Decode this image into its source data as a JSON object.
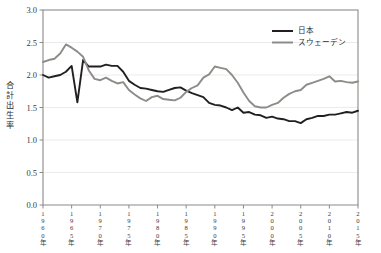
{
  "chart_data": {
    "type": "line",
    "title": "",
    "xlabel": "",
    "ylabel": "合計出生率",
    "xlim": [
      1960,
      2015
    ],
    "ylim": [
      0.0,
      3.0
    ],
    "grid": true,
    "legend_position": "top-right",
    "y_ticks": [
      "0.0",
      "0.5",
      "1.0",
      "1.5",
      "2.0",
      "2.5",
      "3.0"
    ],
    "y_tick_values": [
      0.0,
      0.5,
      1.0,
      1.5,
      2.0,
      2.5,
      3.0
    ],
    "x_ticks": [
      "1960年",
      "1965年",
      "1970年",
      "1975年",
      "1980年",
      "1985年",
      "1990年",
      "1995年",
      "2000年",
      "2005年",
      "2010年",
      "2015年"
    ],
    "x_tick_values": [
      1960,
      1965,
      1970,
      1975,
      1980,
      1985,
      1990,
      1995,
      2000,
      2005,
      2010,
      2015
    ],
    "x": [
      1960,
      1961,
      1962,
      1963,
      1964,
      1965,
      1966,
      1967,
      1968,
      1969,
      1970,
      1971,
      1972,
      1973,
      1974,
      1975,
      1976,
      1977,
      1978,
      1979,
      1980,
      1981,
      1982,
      1983,
      1984,
      1985,
      1986,
      1987,
      1988,
      1989,
      1990,
      1991,
      1992,
      1993,
      1994,
      1995,
      1996,
      1997,
      1998,
      1999,
      2000,
      2001,
      2002,
      2003,
      2004,
      2005,
      2006,
      2007,
      2008,
      2009,
      2010,
      2011,
      2012,
      2013,
      2014,
      2015
    ],
    "series": [
      {
        "name": "日本",
        "color": "#231f20",
        "width": 1.9,
        "values": [
          2.0,
          1.96,
          1.98,
          2.0,
          2.05,
          2.14,
          1.58,
          2.23,
          2.13,
          2.13,
          2.13,
          2.16,
          2.14,
          2.14,
          2.05,
          1.91,
          1.85,
          1.8,
          1.79,
          1.77,
          1.75,
          1.74,
          1.77,
          1.8,
          1.81,
          1.76,
          1.72,
          1.69,
          1.66,
          1.57,
          1.54,
          1.53,
          1.5,
          1.46,
          1.5,
          1.42,
          1.43,
          1.39,
          1.38,
          1.34,
          1.36,
          1.33,
          1.32,
          1.29,
          1.29,
          1.26,
          1.32,
          1.34,
          1.37,
          1.37,
          1.39,
          1.39,
          1.41,
          1.43,
          1.42,
          1.45
        ]
      },
      {
        "name": "スウェーデン",
        "color": "#8c8c88",
        "width": 1.9,
        "values": [
          2.2,
          2.23,
          2.25,
          2.33,
          2.47,
          2.42,
          2.36,
          2.28,
          2.07,
          1.94,
          1.92,
          1.96,
          1.91,
          1.87,
          1.89,
          1.77,
          1.7,
          1.64,
          1.6,
          1.66,
          1.68,
          1.63,
          1.62,
          1.61,
          1.65,
          1.74,
          1.8,
          1.84,
          1.96,
          2.01,
          2.13,
          2.11,
          2.09,
          2.0,
          1.88,
          1.73,
          1.6,
          1.52,
          1.5,
          1.5,
          1.54,
          1.57,
          1.65,
          1.71,
          1.75,
          1.77,
          1.85,
          1.88,
          1.91,
          1.94,
          1.98,
          1.9,
          1.91,
          1.89,
          1.88,
          1.9
        ]
      }
    ],
    "legend": [
      {
        "label": "日本",
        "color": "#231f20"
      },
      {
        "label": "スウェーデン",
        "color": "#8c8c88"
      }
    ]
  }
}
